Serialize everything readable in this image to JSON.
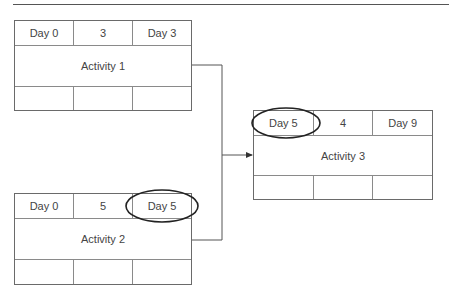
{
  "diagram": {
    "type": "activity-on-node network",
    "nodes": [
      {
        "id": "activity-1",
        "earliest_start": "Day 0",
        "duration": "3",
        "earliest_finish": "Day 3",
        "label": "Activity 1",
        "bottom": [
          "",
          "",
          ""
        ]
      },
      {
        "id": "activity-2",
        "earliest_start": "Day 0",
        "duration": "5",
        "earliest_finish": "Day 5",
        "label": "Activity 2",
        "bottom": [
          "",
          "",
          ""
        ],
        "highlight": "earliest_finish"
      },
      {
        "id": "activity-3",
        "earliest_start": "Day 5",
        "duration": "4",
        "earliest_finish": "Day 9",
        "label": "Activity 3",
        "bottom": [
          "",
          "",
          ""
        ],
        "highlight": "earliest_start"
      }
    ],
    "edges": [
      {
        "from": "activity-1",
        "to": "activity-3"
      },
      {
        "from": "activity-2",
        "to": "activity-3"
      }
    ],
    "colors": {
      "line": "#6a6a6a",
      "text": "#444444",
      "highlight": "#222222"
    }
  }
}
